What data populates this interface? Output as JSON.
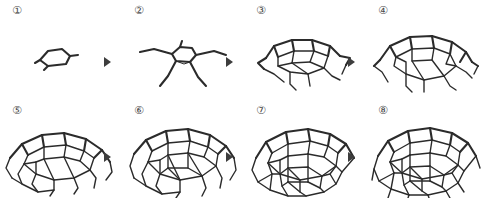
{
  "figure": {
    "type": "process-sequence",
    "rows": 2,
    "columns": 4,
    "background_color": "#ffffff",
    "line_color": "#2b2b2b",
    "label_color": "#4a4a4a",
    "arrow_color": "#3d3d3d",
    "arrow_icon": "solid-right-triangle",
    "steps": [
      {
        "index": 1,
        "label": "①",
        "caption": "single pentagonal cell",
        "cells": 1,
        "struts": 5
      },
      {
        "index": 2,
        "label": "②",
        "caption": "pentagon with splayed legs",
        "cells": 1,
        "struts": 10
      },
      {
        "index": 3,
        "label": "③",
        "caption": "first ring of hexagons added",
        "cells": 6,
        "struts": 22
      },
      {
        "index": 4,
        "label": "④",
        "caption": "ring completed around the crown",
        "cells": 9,
        "struts": 32
      },
      {
        "index": 5,
        "label": "⑤",
        "caption": "shallow dome, second ring started",
        "cells": 14,
        "struts": 46
      },
      {
        "index": 6,
        "label": "⑥",
        "caption": "dome deepens, second ring closed",
        "cells": 20,
        "struts": 62
      },
      {
        "index": 7,
        "label": "⑦",
        "caption": "third ring of cells added",
        "cells": 26,
        "struts": 78
      },
      {
        "index": 8,
        "label": "⑧",
        "caption": "full hemispherical dome",
        "cells": 32,
        "struts": 90
      }
    ],
    "arrows": [
      {
        "from": 1,
        "to": 2,
        "row": "top"
      },
      {
        "from": 2,
        "to": 3,
        "row": "top"
      },
      {
        "from": 3,
        "to": 4,
        "row": "top"
      },
      {
        "from": 5,
        "to": 6,
        "row": "bottom"
      },
      {
        "from": 6,
        "to": 7,
        "row": "bottom"
      },
      {
        "from": 7,
        "to": 8,
        "row": "bottom"
      }
    ]
  }
}
